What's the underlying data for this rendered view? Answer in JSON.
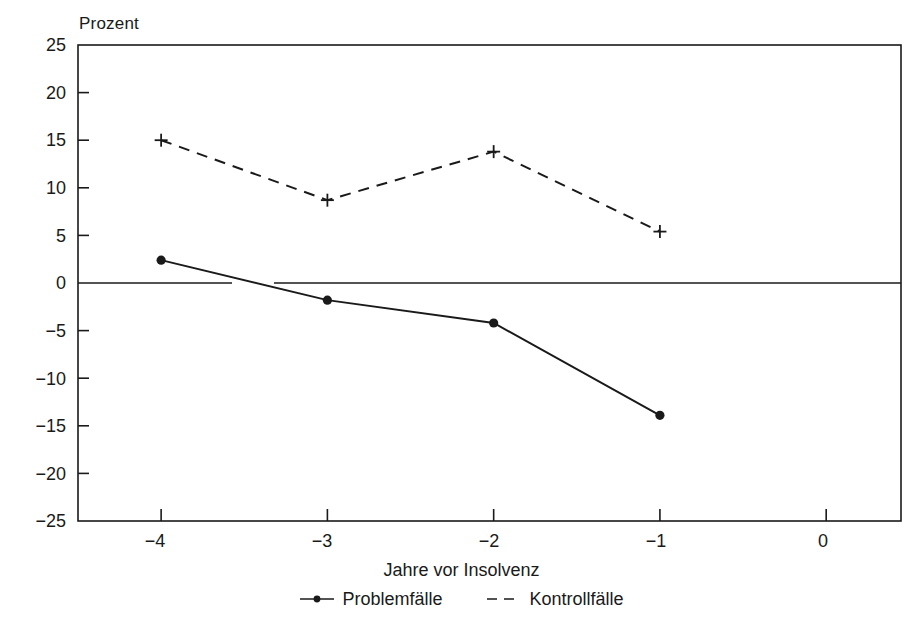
{
  "chart_data": {
    "type": "line",
    "title": "",
    "ylabel": "Prozent",
    "xlabel": "Jahre vor Insolvenz",
    "x": [
      -4,
      -3,
      -2,
      -1,
      0
    ],
    "xtick_labels": [
      "−4",
      "−3",
      "−2",
      "−1",
      "0"
    ],
    "xlim": [
      -4.5,
      0.45
    ],
    "ylim": [
      -25,
      25
    ],
    "ytick_values": [
      25,
      20,
      15,
      10,
      5,
      0,
      -5,
      -10,
      -15,
      -20,
      -25
    ],
    "ytick_labels": [
      "25",
      "20",
      "15",
      "10",
      "5",
      "0",
      "−5",
      "−10",
      "−15",
      "−20",
      "−25"
    ],
    "grid": false,
    "legend_position": "below-axis",
    "zero_reference_line": true,
    "series": [
      {
        "name": "Problemfälle",
        "style": "solid",
        "marker": "filled-circle",
        "color": "#1a1a1a",
        "x": [
          -4,
          -3,
          -2,
          -1
        ],
        "values": [
          2.4,
          -1.8,
          -4.2,
          -13.9
        ]
      },
      {
        "name": "Kontrollfälle",
        "style": "dashed",
        "marker": "plus",
        "color": "#1a1a1a",
        "x": [
          -4,
          -3,
          -2,
          -1
        ],
        "values": [
          15.0,
          8.7,
          13.8,
          5.4
        ]
      }
    ]
  },
  "legend": {
    "items": [
      {
        "label": "Problemfälle",
        "marker": "line-with-dot-icon"
      },
      {
        "label": "Kontrollfälle",
        "marker": "dashed-line-icon"
      }
    ]
  },
  "axis": {
    "y_label": "Prozent",
    "x_label": "Jahre vor Insolvenz"
  }
}
